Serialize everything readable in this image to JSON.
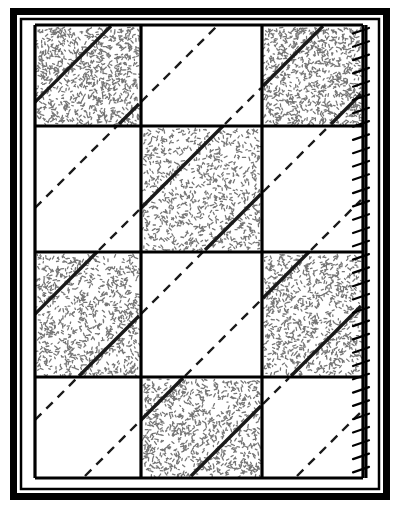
{
  "figure": {
    "type": "quilting-pattern-diagram",
    "colors": {
      "ink": "#000000",
      "paper": "#ffffff",
      "shaded_fill": "#6e6e6e",
      "dashed_line": "#1a1a1a"
    },
    "outer_border": {
      "name": "outer-frame",
      "x": 10,
      "y": 8,
      "width": 380,
      "height": 492,
      "stroke_width": 7
    },
    "inner_border": {
      "name": "inner-frame",
      "x": 21,
      "y": 19,
      "width": 358,
      "height": 470,
      "stroke_width": 2.5
    },
    "grid": {
      "name": "patch-grid",
      "columns": 3,
      "rows": 4,
      "x": 35,
      "y": 25,
      "width": 328,
      "height": 453,
      "column_edges": [
        35,
        141,
        262,
        363
      ],
      "row_edges": [
        25,
        126,
        252,
        377,
        478
      ],
      "seam_stroke_width": 3.2
    },
    "patches": [
      {
        "id": "r1c1",
        "row": 1,
        "col": 1,
        "fill": "shaded",
        "diagonal": "solid",
        "label": "shaded-patch"
      },
      {
        "id": "r1c2",
        "row": 1,
        "col": 2,
        "fill": "plain",
        "diagonal": "dashed",
        "label": "plain-patch"
      },
      {
        "id": "r1c3",
        "row": 1,
        "col": 3,
        "fill": "shaded",
        "diagonal": "solid",
        "label": "shaded-patch"
      },
      {
        "id": "r2c1",
        "row": 2,
        "col": 1,
        "fill": "plain",
        "diagonal": "dashed",
        "label": "plain-patch"
      },
      {
        "id": "r2c2",
        "row": 2,
        "col": 2,
        "fill": "shaded",
        "diagonal": "solid",
        "label": "shaded-patch"
      },
      {
        "id": "r2c3",
        "row": 2,
        "col": 3,
        "fill": "plain",
        "diagonal": "dashed",
        "label": "plain-patch"
      },
      {
        "id": "r3c1",
        "row": 3,
        "col": 1,
        "fill": "shaded",
        "diagonal": "solid",
        "label": "shaded-patch"
      },
      {
        "id": "r3c2",
        "row": 3,
        "col": 2,
        "fill": "plain",
        "diagonal": "dashed",
        "label": "plain-patch"
      },
      {
        "id": "r3c3",
        "row": 3,
        "col": 3,
        "fill": "shaded",
        "diagonal": "solid",
        "label": "shaded-patch"
      },
      {
        "id": "r4c1",
        "row": 4,
        "col": 1,
        "fill": "plain",
        "diagonal": "dashed",
        "label": "plain-patch"
      },
      {
        "id": "r4c2",
        "row": 4,
        "col": 2,
        "fill": "shaded",
        "diagonal": "solid",
        "label": "shaded-patch"
      },
      {
        "id": "r4c3",
        "row": 4,
        "col": 3,
        "fill": "plain",
        "diagonal": "dashed",
        "label": "plain-patch"
      }
    ],
    "quilting_diagonals": {
      "name": "diagonal-quilting-lines",
      "direction": "bottom-left-to-top-right",
      "dash_pattern": "9 7",
      "stroke_width": 2.4,
      "count_continuous_runs": 6
    },
    "binding_stitch": {
      "name": "whipstitch-binding-edge",
      "x": 366,
      "y_start": 25,
      "y_end": 478,
      "spine_stroke_width": 3.0,
      "barb_count": 34,
      "barb_spacing": 13.3,
      "barb_length": 13,
      "barb_stroke_width": 2.2,
      "description": "vertical binding line along right edge with angled whipstitch barbs pointing left"
    },
    "speckle": {
      "name": "speckle-texture",
      "dot_count_per_patch": 900,
      "dot_radius": 0.85,
      "seed": 20240917
    }
  }
}
